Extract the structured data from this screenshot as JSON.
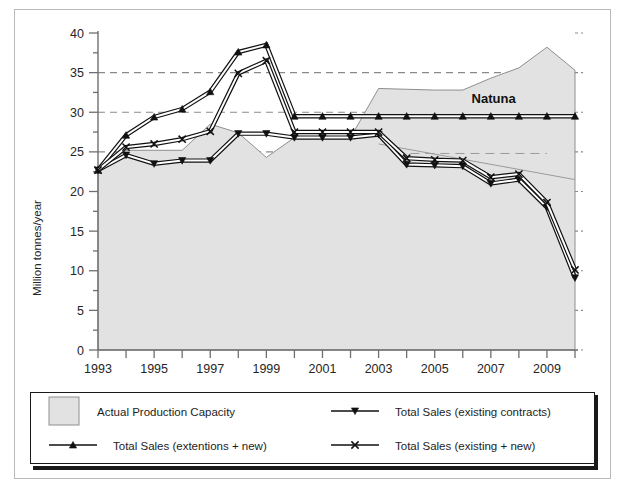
{
  "figure": {
    "annotation": "Natuna",
    "background": "#ffffff",
    "area_fill": "#e2e2e2",
    "line_color": "#111111",
    "grid_color": "#8a8a8a"
  },
  "chart_data": {
    "type": "area",
    "title": "",
    "xlabel": "",
    "ylabel": "Million tonnes/year",
    "xlim": [
      1993,
      2010
    ],
    "ylim": [
      0,
      40
    ],
    "yticks": [
      0,
      5,
      10,
      15,
      20,
      25,
      30,
      35,
      40
    ],
    "ytick_minor_step": 2.5,
    "xticks": [
      1993,
      1994,
      1995,
      1996,
      1997,
      1998,
      1999,
      2000,
      2001,
      2002,
      2003,
      2004,
      2005,
      2006,
      2007,
      2008,
      2009,
      2010
    ],
    "xtick_labels": [
      "1993",
      "",
      "1995",
      "",
      "1997",
      "",
      "1999",
      "",
      "2001",
      "",
      "2003",
      "",
      "2005",
      "",
      "2007",
      "",
      "2009",
      ""
    ],
    "gridlines": [
      25,
      30,
      35
    ],
    "grid": "horizontal-dashed",
    "legend_position": "bottom",
    "annotations": [
      {
        "text": "Natuna",
        "x": 2007.1,
        "y": 31.2
      }
    ],
    "x": [
      1993,
      1994,
      1995,
      1996,
      1997,
      1998,
      1999,
      2000,
      2001,
      2002,
      2003,
      2004,
      2005,
      2006,
      2007,
      2008,
      2009,
      2010
    ],
    "series": [
      {
        "name": "Actual Production Capacity",
        "kind": "area",
        "marker": "none",
        "values": [
          22.7,
          25.2,
          25.2,
          25.2,
          28.5,
          27.4,
          24.3,
          26.8,
          26.8,
          26.8,
          33.0,
          32.9,
          32.8,
          32.8,
          34.3,
          35.6,
          38.2,
          35.3
        ]
      },
      {
        "name": "Total Sales (existing contracts)",
        "kind": "line",
        "marker": "triangle-down",
        "values": [
          22.7,
          24.6,
          23.5,
          23.9,
          23.9,
          27.3,
          27.3,
          26.8,
          26.8,
          26.8,
          27.2,
          23.4,
          23.3,
          23.2,
          21.0,
          21.5,
          18.0,
          9.1
        ]
      },
      {
        "name": "Total Sales (extentions + new)",
        "kind": "line",
        "marker": "triangle-up",
        "values": [
          22.7,
          27.1,
          29.4,
          30.4,
          32.6,
          37.6,
          38.5,
          29.5,
          29.5,
          29.5,
          29.5,
          29.5,
          29.5,
          29.5,
          29.5,
          29.5,
          29.5,
          29.5
        ]
      },
      {
        "name": "Total Sales (existing + new)",
        "kind": "line",
        "marker": "x-cross",
        "values": [
          22.7,
          25.6,
          26.0,
          26.6,
          27.6,
          34.9,
          36.5,
          27.5,
          27.5,
          27.5,
          27.5,
          24.2,
          24.0,
          23.9,
          21.8,
          22.2,
          18.6,
          10.1
        ]
      }
    ],
    "auxiliary_lines": [
      {
        "name": "capacity-guide-thin",
        "color": "#9a9a9a",
        "style": "solid",
        "x": [
          2003,
          2010
        ],
        "y": [
          26.0,
          21.5
        ]
      },
      {
        "name": "capacity-guide-dashed",
        "color": "#9a9a9a",
        "style": "dashed",
        "x": [
          2003.6,
          2009
        ],
        "y": [
          24.8,
          24.8
        ]
      }
    ]
  },
  "legend": {
    "items": [
      {
        "label": "Actual Production Capacity",
        "symbol": "swatch"
      },
      {
        "label": "Total Sales (existing contracts)",
        "symbol": "line-triangle-down"
      },
      {
        "label": "Total Sales (extentions + new)",
        "symbol": "line-triangle-up"
      },
      {
        "label": "Total Sales (existing + new)",
        "symbol": "line-x-cross"
      }
    ]
  }
}
